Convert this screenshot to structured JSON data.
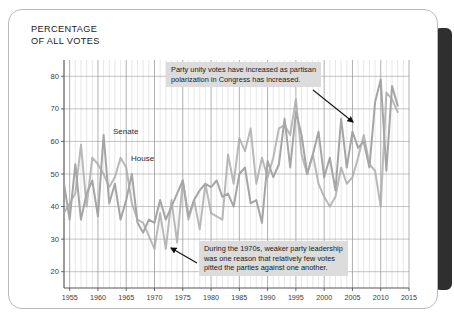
{
  "figure": {
    "title": "PERCENTAGE\nOF ALL VOTES"
  },
  "chart_data": {
    "type": "line",
    "title": "PERCENTAGE OF ALL VOTES",
    "xlabel": "",
    "ylabel": "PERCENTAGE OF ALL VOTES",
    "xlim": [
      1954,
      2015
    ],
    "ylim": [
      15,
      85
    ],
    "yticks": [
      20,
      30,
      40,
      50,
      60,
      70,
      80
    ],
    "xticks": [
      1955,
      1960,
      1965,
      1970,
      1975,
      1980,
      1985,
      1990,
      1995,
      2000,
      2005,
      2010,
      2015
    ],
    "grid": "both",
    "legend": "inline-labels",
    "x": [
      1954,
      1955,
      1956,
      1957,
      1958,
      1959,
      1960,
      1961,
      1962,
      1963,
      1964,
      1965,
      1966,
      1967,
      1968,
      1969,
      1970,
      1971,
      1972,
      1973,
      1974,
      1975,
      1976,
      1977,
      1978,
      1979,
      1980,
      1981,
      1982,
      1983,
      1984,
      1985,
      1986,
      1987,
      1988,
      1989,
      1990,
      1991,
      1992,
      1993,
      1994,
      1995,
      1996,
      1997,
      1998,
      1999,
      2000,
      2001,
      2002,
      2003,
      2004,
      2005,
      2006,
      2007,
      2008,
      2009,
      2010,
      2011,
      2012,
      2013
    ],
    "series": [
      {
        "name": "Senate",
        "color": "#a0a0a0",
        "values": [
          47,
          36,
          53,
          36,
          44,
          48,
          37,
          62,
          41,
          47,
          36,
          42,
          50,
          35,
          32,
          36,
          35,
          42,
          36,
          40,
          44,
          48,
          37,
          42,
          45,
          47,
          46,
          48,
          43,
          44,
          40,
          50,
          52,
          41,
          42,
          35,
          54,
          49,
          53,
          67,
          52,
          69,
          62,
          50,
          56,
          63,
          49,
          55,
          45,
          67,
          52,
          63,
          58,
          60,
          52,
          72,
          79,
          51,
          77,
          71
        ]
      },
      {
        "name": "House",
        "color": "#a8a8a8",
        "values": [
          38,
          41,
          44,
          59,
          40,
          55,
          53,
          50,
          46,
          49,
          55,
          52,
          41,
          36,
          35,
          31,
          27,
          38,
          27,
          42,
          29,
          48,
          36,
          42,
          33,
          47,
          38,
          37,
          36,
          56,
          47,
          61,
          57,
          64,
          47,
          55,
          49,
          55,
          64,
          65,
          62,
          73,
          56,
          50,
          56,
          47,
          43,
          40,
          43,
          52,
          47,
          49,
          55,
          62,
          53,
          51,
          40,
          75,
          73,
          69
        ]
      }
    ],
    "annotations": [
      {
        "id": "annotation-top",
        "text": "Party unity votes have increased as partisan\npolarization in Congress has increased.",
        "arrow": "points to Senate line near 2002"
      },
      {
        "id": "annotation-bottom",
        "text": "During the 1970s, weaker party leadership\nwas one reason that relatively few votes\npitted the parties against one another.",
        "arrow": "points to House line near 1972"
      }
    ]
  },
  "colors": {
    "senate_line": "#a0a0a0",
    "house_line": "#a8a8a8",
    "gridline": "#cfcfcf",
    "major_gridline": "#9b9b9b",
    "axis": "#555555",
    "annotation_bg": "#dcdcdc",
    "card_border": "#b9b9b9",
    "page_edge": "#2f2f2f"
  }
}
